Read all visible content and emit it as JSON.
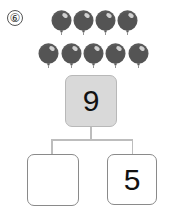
{
  "problem": {
    "number_label": "⑥",
    "balloons": {
      "color": "#5a5a5a",
      "rows": [
        {
          "count": 4,
          "centers_x": [
            61,
            83,
            105,
            127
          ],
          "top_y": 10
        },
        {
          "count": 5,
          "centers_x": [
            48,
            71,
            93,
            115,
            138
          ],
          "top_y": 43
        }
      ],
      "total": 9
    },
    "number_bond": {
      "whole": "9",
      "part_left": "",
      "part_right": "5"
    }
  }
}
